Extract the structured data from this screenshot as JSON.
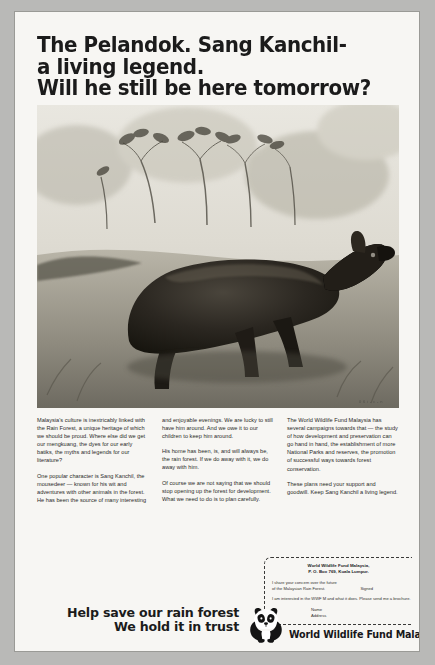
{
  "headline": {
    "lines": [
      "The Pelandok. Sang Kanchil-",
      "a living legend.",
      "Will he still be here tomorrow?"
    ]
  },
  "photo": {
    "alt_name": "mousedeer-photograph",
    "credit": "0 6 i - c - n"
  },
  "body": {
    "column_1": [
      "Malaysia's culture is inextricably linked with the Rain Forest, a unique heritage of which we should be proud. Where else did we get our mengkuang, the dyes for our early batiks, the myths and legends for our literature?",
      "One popular character is Sang Kanchil, the mousedeer — known for his wit and adventures with other animals in the forest. He has been the source of many interesting"
    ],
    "column_2": [
      "and enjoyable evenings. We are lucky to still have him around. And we owe it to our children to keep him around.",
      "His home has been, is, and will always be, the rain forest. If we do away with it, we do away with him.",
      "Of course we are not saying that we should stop opening up the forest for development. What we need to do is to plan carefully."
    ],
    "column_3": [
      "The World Wildlife Fund Malaysia has several campaigns towards that — the study of how development and preservation can go hand in hand, the establishment of more National Parks and reserves, the promotion of successful ways towards forest conservation.",
      "These plans need your support and goodwill. Keep Sang Kanchil a living legend."
    ]
  },
  "coupon": {
    "cut_instruction": "Cut out the coupon and send it to",
    "address_line_1": "World Wildlife Fund Malaysia,",
    "address_line_2": "P. O. Box 769, Kuala Lumpur.",
    "pledge_line_1": "I share your concern over the future",
    "pledge_line_2": "of the Malaysian Rain Forest.",
    "signed_label": "Signed",
    "brochure_line": "I am interested in the WWF M and what it does. Please send me a brochure.",
    "field_name": "Name",
    "field_address": "Address"
  },
  "slogan": {
    "line_1": "Help save our rain forest",
    "line_2": "We hold it in trust"
  },
  "wwf": {
    "wordmark": "World Wildlife Fund Malaysia",
    "panda_icon": "panda-icon"
  },
  "colors": {
    "ink": "#1b1b1b",
    "page": "#f7f6f3",
    "surround": "#b9b9b7"
  }
}
